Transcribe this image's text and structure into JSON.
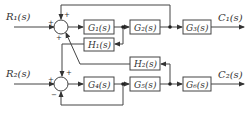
{
  "inputs": [
    {
      "id": "R1",
      "label": "R₁(s)"
    },
    {
      "id": "R2",
      "label": "R₂(s)"
    }
  ],
  "outputs": [
    {
      "id": "C1",
      "label": "C₁(s)"
    },
    {
      "id": "C2",
      "label": "C₂(s)"
    }
  ],
  "blocks": {
    "G1": "G₁(s)",
    "G2": "G₂(s)",
    "G3": "G₃(s)",
    "G4": "G₄(s)",
    "G5": "G₅(s)",
    "G6": "G₆(s)",
    "H1": "H₁(s)",
    "H2": "H₂(s)"
  },
  "summing_junctions": {
    "top": {
      "left": "+",
      "top": "+",
      "bottom": "+"
    },
    "bottom": {
      "left": "+",
      "top": "+",
      "bottom": "−"
    }
  },
  "colors": {
    "line": "#444444",
    "text": "#333333",
    "background": "#ffffff"
  }
}
